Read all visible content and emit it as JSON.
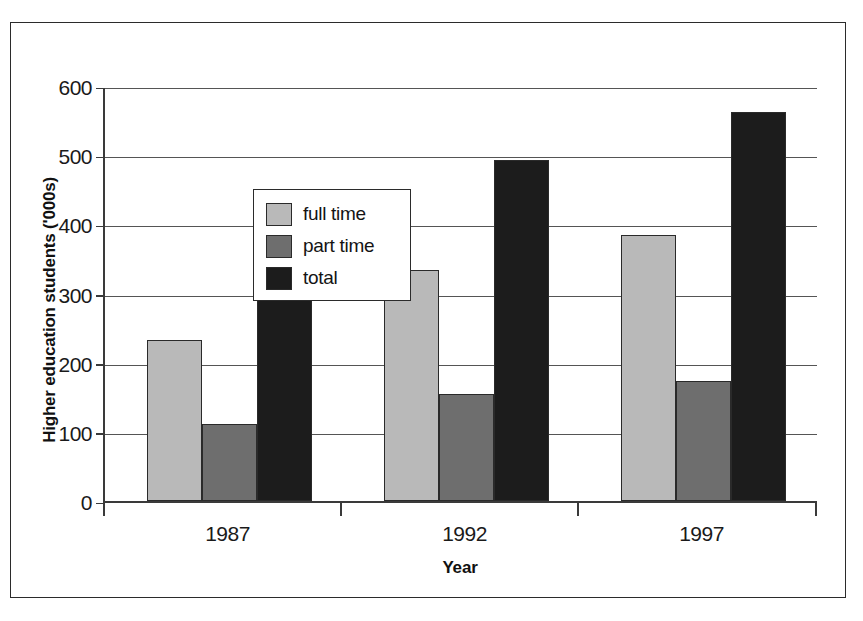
{
  "chart_data": {
    "type": "bar",
    "title": "",
    "xlabel": "Year",
    "ylabel": "Higher education students ('000s)",
    "categories": [
      "1987",
      "1992",
      "1997"
    ],
    "series": [
      {
        "name": "full time",
        "color": "#b9b9b9",
        "values": [
          233,
          334,
          384
        ]
      },
      {
        "name": "part time",
        "color": "#6e6e6e",
        "values": [
          112,
          155,
          174
        ]
      },
      {
        "name": "total",
        "color": "#1c1c1c",
        "values": [
          344,
          493,
          562
        ]
      }
    ],
    "ylim": [
      0,
      600
    ],
    "yticks": [
      0,
      100,
      200,
      300,
      400,
      500,
      600
    ],
    "ytick_labels": [
      "0",
      "100",
      "200",
      "300",
      "400",
      "500",
      "600"
    ],
    "grid": true,
    "legend_position": "upper-left-inside",
    "legend_entries": [
      "full time",
      "part time",
      "total"
    ]
  },
  "figure": {
    "border_color": "#2b2b2b",
    "background": "#ffffff",
    "axis_color": "#3a3a3a",
    "gridline_color": "#555555"
  }
}
